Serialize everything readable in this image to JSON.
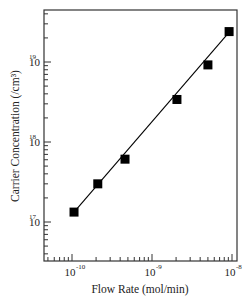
{
  "chart_data": {
    "type": "scatter",
    "title": "",
    "xlabel": "Flow Rate (mol/min)",
    "ylabel": "Carrier Concentration (/cm³)",
    "xscale": "log",
    "yscale": "log",
    "xlim": [
      3.5e-11,
      1.05e-08
    ],
    "ylim": [
      5e+16,
      4.5e+19
    ],
    "x_ticks": [
      {
        "value": 1e-10,
        "label_base": "10",
        "label_exp": "-10"
      },
      {
        "value": 1e-09,
        "label_base": "10",
        "label_exp": "-9"
      },
      {
        "value": 1e-08,
        "label_base": "10",
        "label_exp": "-8"
      }
    ],
    "y_ticks": [
      {
        "value": 1e+17,
        "label_base": "10",
        "label_exp": "17"
      },
      {
        "value": 1e+18,
        "label_base": "10",
        "label_exp": "18"
      },
      {
        "value": 1e+19,
        "label_base": "10",
        "label_exp": "19"
      }
    ],
    "grid": false,
    "legend": null,
    "series": [
      {
        "name": "data",
        "marker": "filled-square",
        "color": "#000000",
        "x": [
          1.06e-10,
          2.1e-10,
          4.6e-10,
          2.05e-09,
          5e-09,
          9.2e-09
        ],
        "y": [
          1.33e+17,
          3e+17,
          6.1e+17,
          3.4e+18,
          9.2e+18,
          2.4e+19
        ]
      },
      {
        "name": "fit",
        "type": "line",
        "color": "#000000",
        "x": [
          1.06e-10,
          1e-08
        ],
        "y": [
          1.33e+17,
          2.6e+19
        ]
      }
    ]
  },
  "colors": {
    "axis": "#333333",
    "marker": "#000000",
    "background": "#ffffff"
  }
}
